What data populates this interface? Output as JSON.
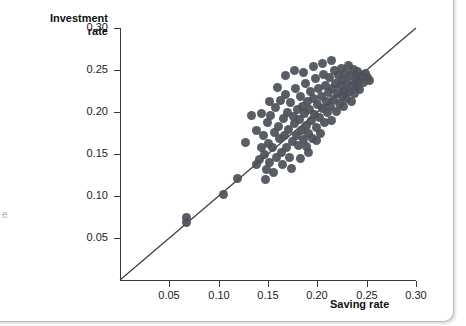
{
  "figure": {
    "edge_fragment": "e"
  },
  "chart_data": {
    "type": "scatter",
    "title": "",
    "xlabel": "Saving rate",
    "ylabel": "Investment rate",
    "ylabel_lines": [
      "Investment",
      "rate"
    ],
    "xlim": [
      0.0,
      0.3
    ],
    "ylim": [
      0.0,
      0.3
    ],
    "xticks": [
      0.05,
      0.1,
      0.15,
      0.2,
      0.25,
      0.3
    ],
    "xticklabels": [
      "0.05",
      "0.10",
      "0.15",
      "0.20",
      "0.25",
      "0.30"
    ],
    "yticks": [
      0.05,
      0.1,
      0.15,
      0.2,
      0.25,
      0.3
    ],
    "yticklabels": [
      "0.05",
      "0.10",
      "0.15",
      "0.20",
      "0.25",
      "0.30"
    ],
    "grid": false,
    "legend": "none",
    "marker_color": "#4c515a",
    "line_color": "#3a3a3a",
    "reference_line": {
      "label": "45-degree line",
      "x": [
        0.0,
        0.3
      ],
      "y": [
        0.0,
        0.3
      ]
    },
    "points": [
      [
        0.067,
        0.068
      ],
      [
        0.067,
        0.074
      ],
      [
        0.105,
        0.102
      ],
      [
        0.119,
        0.121
      ],
      [
        0.138,
        0.137
      ],
      [
        0.141,
        0.143
      ],
      [
        0.143,
        0.158
      ],
      [
        0.145,
        0.172
      ],
      [
        0.146,
        0.15
      ],
      [
        0.148,
        0.131
      ],
      [
        0.149,
        0.187
      ],
      [
        0.15,
        0.163
      ],
      [
        0.152,
        0.14
      ],
      [
        0.153,
        0.196
      ],
      [
        0.155,
        0.158
      ],
      [
        0.157,
        0.176
      ],
      [
        0.158,
        0.205
      ],
      [
        0.159,
        0.146
      ],
      [
        0.161,
        0.183
      ],
      [
        0.162,
        0.168
      ],
      [
        0.163,
        0.214
      ],
      [
        0.164,
        0.152
      ],
      [
        0.166,
        0.192
      ],
      [
        0.167,
        0.172
      ],
      [
        0.168,
        0.221
      ],
      [
        0.169,
        0.158
      ],
      [
        0.17,
        0.2
      ],
      [
        0.171,
        0.179
      ],
      [
        0.172,
        0.146
      ],
      [
        0.173,
        0.211
      ],
      [
        0.175,
        0.165
      ],
      [
        0.176,
        0.195
      ],
      [
        0.177,
        0.186
      ],
      [
        0.178,
        0.228
      ],
      [
        0.179,
        0.172
      ],
      [
        0.18,
        0.203
      ],
      [
        0.181,
        0.16
      ],
      [
        0.182,
        0.191
      ],
      [
        0.183,
        0.219
      ],
      [
        0.184,
        0.178
      ],
      [
        0.185,
        0.207
      ],
      [
        0.186,
        0.167
      ],
      [
        0.187,
        0.198
      ],
      [
        0.188,
        0.234
      ],
      [
        0.189,
        0.184
      ],
      [
        0.19,
        0.212
      ],
      [
        0.191,
        0.175
      ],
      [
        0.192,
        0.203
      ],
      [
        0.193,
        0.225
      ],
      [
        0.194,
        0.19
      ],
      [
        0.195,
        0.168
      ],
      [
        0.196,
        0.216
      ],
      [
        0.197,
        0.197
      ],
      [
        0.198,
        0.24
      ],
      [
        0.199,
        0.181
      ],
      [
        0.2,
        0.209
      ],
      [
        0.201,
        0.228
      ],
      [
        0.202,
        0.193
      ],
      [
        0.203,
        0.174
      ],
      [
        0.204,
        0.219
      ],
      [
        0.205,
        0.204
      ],
      [
        0.206,
        0.245
      ],
      [
        0.207,
        0.188
      ],
      [
        0.208,
        0.232
      ],
      [
        0.209,
        0.212
      ],
      [
        0.21,
        0.199
      ],
      [
        0.211,
        0.223
      ],
      [
        0.212,
        0.241
      ],
      [
        0.213,
        0.206
      ],
      [
        0.214,
        0.19
      ],
      [
        0.215,
        0.228
      ],
      [
        0.216,
        0.215
      ],
      [
        0.217,
        0.249
      ],
      [
        0.218,
        0.234
      ],
      [
        0.219,
        0.201
      ],
      [
        0.22,
        0.222
      ],
      [
        0.221,
        0.243
      ],
      [
        0.222,
        0.21
      ],
      [
        0.223,
        0.231
      ],
      [
        0.224,
        0.252
      ],
      [
        0.225,
        0.218
      ],
      [
        0.226,
        0.238
      ],
      [
        0.227,
        0.207
      ],
      [
        0.228,
        0.226
      ],
      [
        0.229,
        0.246
      ],
      [
        0.23,
        0.216
      ],
      [
        0.231,
        0.235
      ],
      [
        0.232,
        0.255
      ],
      [
        0.233,
        0.224
      ],
      [
        0.234,
        0.243
      ],
      [
        0.235,
        0.213
      ],
      [
        0.236,
        0.232
      ],
      [
        0.237,
        0.251
      ],
      [
        0.238,
        0.222
      ],
      [
        0.239,
        0.24
      ],
      [
        0.24,
        0.23
      ],
      [
        0.241,
        0.248
      ],
      [
        0.242,
        0.237
      ],
      [
        0.243,
        0.227
      ],
      [
        0.245,
        0.244
      ],
      [
        0.247,
        0.235
      ],
      [
        0.249,
        0.246
      ],
      [
        0.251,
        0.241
      ],
      [
        0.253,
        0.237
      ],
      [
        0.143,
        0.198
      ],
      [
        0.152,
        0.213
      ],
      [
        0.16,
        0.229
      ],
      [
        0.147,
        0.12
      ],
      [
        0.156,
        0.128
      ],
      [
        0.165,
        0.137
      ],
      [
        0.174,
        0.133
      ],
      [
        0.183,
        0.145
      ],
      [
        0.191,
        0.152
      ],
      [
        0.168,
        0.243
      ],
      [
        0.177,
        0.25
      ],
      [
        0.186,
        0.247
      ],
      [
        0.196,
        0.254
      ],
      [
        0.205,
        0.258
      ],
      [
        0.214,
        0.261
      ],
      [
        0.133,
        0.196
      ],
      [
        0.138,
        0.178
      ],
      [
        0.127,
        0.164
      ],
      [
        0.199,
        0.166
      ],
      [
        0.189,
        0.159
      ]
    ]
  }
}
